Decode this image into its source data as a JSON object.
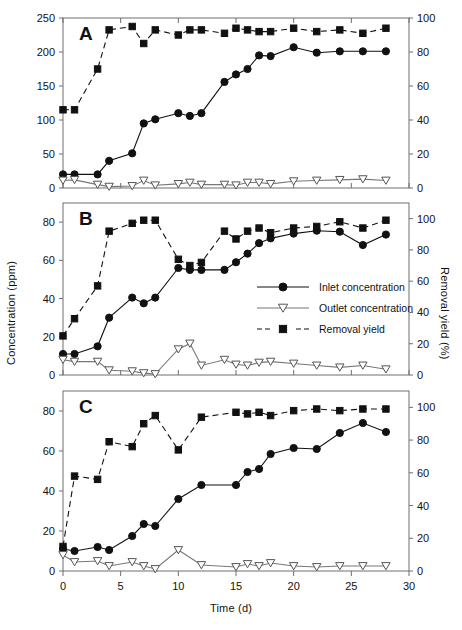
{
  "figure": {
    "xlabel": "Time (d)",
    "ylabel_left": "Concentration (ppm)",
    "ylabel_right": "Removal yield (%)",
    "panel_labels": [
      "A",
      "B",
      "C"
    ]
  },
  "legend": {
    "position": "panel-B-right-center",
    "items": [
      {
        "label": "Inlet concentration",
        "marker": "filled-circle",
        "line": "solid",
        "color": "#111111"
      },
      {
        "label": "Outlet concentration",
        "marker": "open-down-triangle",
        "line": "solid",
        "color": "#777777"
      },
      {
        "label": "Removal yield",
        "marker": "filled-square",
        "line": "dashed",
        "color": "#111111"
      }
    ]
  },
  "chart_data": [
    {
      "type": "line",
      "panel": "A",
      "title": "A",
      "xlabel": "Time (d)",
      "ylabel": "Concentration (ppm)",
      "ylabel_right": "Removal yield (%)",
      "xlim": [
        0,
        30
      ],
      "ylim": [
        0,
        250
      ],
      "ylim_right": [
        0,
        100
      ],
      "xticks": [
        0,
        5,
        10,
        15,
        20,
        25,
        30
      ],
      "yticks": [
        0,
        50,
        100,
        150,
        200,
        250
      ],
      "yticks_right": [
        0,
        20,
        40,
        60,
        80,
        100
      ],
      "grid": false,
      "series": [
        {
          "name": "Inlet concentration",
          "axis": "left",
          "x": [
            0,
            1,
            3,
            4,
            6,
            7,
            8,
            10,
            11,
            12,
            14,
            15,
            16,
            17,
            18,
            20,
            22,
            24,
            26,
            28
          ],
          "values": [
            20,
            20,
            20,
            40,
            51,
            95,
            101,
            110,
            106,
            110,
            156,
            167,
            175,
            195,
            194,
            207,
            199,
            201,
            201,
            201
          ]
        },
        {
          "name": "Outlet concentration",
          "axis": "left",
          "x": [
            0,
            1,
            3,
            4,
            6,
            7,
            8,
            10,
            11,
            12,
            14,
            15,
            16,
            17,
            18,
            20,
            22,
            24,
            26,
            28
          ],
          "values": [
            11,
            12,
            5,
            2,
            3,
            11,
            4,
            6,
            8,
            5,
            5,
            4,
            8,
            8,
            6,
            10,
            11,
            12,
            13,
            11
          ]
        },
        {
          "name": "Removal yield",
          "axis": "right",
          "x": [
            0,
            1,
            3,
            4,
            6,
            7,
            8,
            10,
            11,
            12,
            14,
            15,
            16,
            17,
            18,
            20,
            22,
            24,
            26,
            28
          ],
          "values": [
            46,
            46,
            70,
            93,
            95,
            85,
            93,
            90,
            93,
            93,
            91,
            94,
            93,
            92,
            92,
            94,
            92,
            93,
            91,
            94
          ]
        }
      ]
    },
    {
      "type": "line",
      "panel": "B",
      "title": "B",
      "xlabel": "Time (d)",
      "ylabel": "Concentration (ppm)",
      "ylabel_right": "Removal yield (%)",
      "xlim": [
        0,
        30
      ],
      "ylim": [
        0,
        90
      ],
      "ylim_right": [
        0,
        110
      ],
      "xticks": [
        0,
        5,
        10,
        15,
        20,
        25,
        30
      ],
      "yticks": [
        0,
        20,
        40,
        60,
        80
      ],
      "yticks_right": [
        0,
        20,
        40,
        60,
        80,
        100
      ],
      "grid": false,
      "series": [
        {
          "name": "Inlet concentration",
          "axis": "left",
          "x": [
            0,
            1,
            3,
            4,
            6,
            7,
            8,
            10,
            11,
            12,
            14,
            15,
            16,
            17,
            18,
            20,
            22,
            24,
            26,
            28
          ],
          "values": [
            11,
            11,
            15,
            30,
            40.5,
            37.5,
            40.5,
            56,
            55,
            55,
            55,
            59,
            63.5,
            69,
            71.5,
            74,
            75.5,
            75,
            68,
            73.5
          ]
        },
        {
          "name": "Outlet concentration",
          "axis": "left",
          "x": [
            0,
            1,
            3,
            4,
            6,
            7,
            8,
            10,
            11,
            12,
            14,
            15,
            16,
            17,
            18,
            20,
            22,
            24,
            26,
            28
          ],
          "values": [
            8,
            7,
            7,
            2.5,
            2,
            1,
            0.5,
            13.5,
            16.5,
            5,
            8,
            5.5,
            5,
            6.5,
            7,
            6,
            5,
            4,
            5,
            3
          ]
        },
        {
          "name": "Removal yield",
          "axis": "right",
          "x": [
            0,
            1,
            3,
            4,
            6,
            7,
            8,
            10,
            11,
            12,
            14,
            15,
            16,
            17,
            18,
            20,
            22,
            24,
            26,
            28
          ],
          "values": [
            25,
            36,
            57,
            92,
            97,
            99,
            99,
            74,
            70,
            72,
            92,
            87,
            92,
            94,
            91,
            94,
            95,
            98,
            94,
            99
          ]
        }
      ]
    },
    {
      "type": "line",
      "panel": "C",
      "title": "C",
      "xlabel": "Time (d)",
      "ylabel": "Concentration (ppm)",
      "ylabel_right": "Removal yield (%)",
      "xlim": [
        0,
        30
      ],
      "ylim": [
        0,
        90
      ],
      "ylim_right": [
        0,
        110
      ],
      "xticks": [
        0,
        5,
        10,
        15,
        20,
        25,
        30
      ],
      "yticks": [
        0,
        20,
        40,
        60,
        80
      ],
      "yticks_right": [
        0,
        20,
        40,
        60,
        80,
        100
      ],
      "grid": false,
      "series": [
        {
          "name": "Inlet concentration",
          "axis": "left",
          "x": [
            0,
            1,
            3,
            4,
            6,
            7,
            8,
            10,
            12,
            15,
            16,
            17,
            18,
            20,
            22,
            24,
            26,
            28
          ],
          "values": [
            11,
            10,
            12,
            10.5,
            17.5,
            23.5,
            22.5,
            36,
            43,
            43,
            49.5,
            51,
            58.5,
            61.5,
            61,
            69,
            74,
            69.5
          ]
        },
        {
          "name": "Outlet concentration",
          "axis": "left",
          "x": [
            0,
            1,
            3,
            4,
            6,
            7,
            8,
            10,
            12,
            15,
            16,
            17,
            18,
            20,
            22,
            24,
            26,
            28
          ],
          "values": [
            8,
            4.5,
            5,
            2.5,
            4.5,
            2.5,
            1,
            10.5,
            3,
            2,
            3.5,
            2.5,
            4,
            2.5,
            2,
            2.5,
            2.5,
            2.5
          ]
        },
        {
          "name": "Removal yield",
          "axis": "right",
          "x": [
            0,
            1,
            3,
            4,
            6,
            7,
            8,
            10,
            12,
            15,
            16,
            17,
            18,
            20,
            22,
            24,
            26,
            28
          ],
          "values": [
            15,
            58,
            56,
            79,
            76,
            90,
            95,
            74,
            94,
            97,
            96,
            97,
            95,
            98,
            99,
            98,
            99,
            99
          ]
        }
      ]
    }
  ]
}
